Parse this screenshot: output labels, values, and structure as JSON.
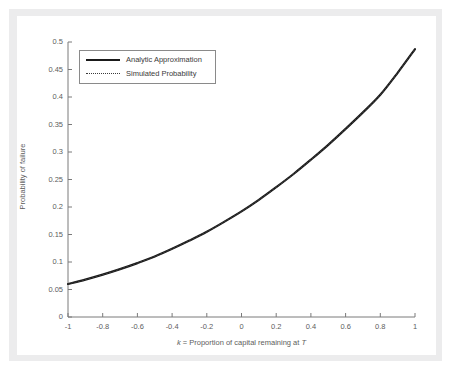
{
  "figure": {
    "background_color": "#ffffff",
    "frame_color": "#ececed",
    "axis_color": "#7a7a7a",
    "curve_color": "#1a1a1a"
  },
  "chart_data": {
    "type": "line",
    "title": "",
    "xlabel": "k = Proportion of capital remaining at T",
    "xlabel_parts": {
      "italic_k": "k",
      "middle": " = Proportion of capital remaining at ",
      "italic_T": "T"
    },
    "ylabel": "Probability of failure",
    "xlim": [
      -1,
      1
    ],
    "ylim": [
      0,
      0.5
    ],
    "grid": false,
    "legend_position": "upper left",
    "xticks": [
      -1,
      -0.8,
      -0.6,
      -0.4,
      -0.2,
      0,
      0.2,
      0.4,
      0.6,
      0.8,
      1
    ],
    "xtick_labels": [
      "-1",
      "-0.8",
      "-0.6",
      "-0.4",
      "-0.2",
      "0",
      "0.2",
      "0.4",
      "0.6",
      "0.8",
      "1"
    ],
    "yticks": [
      0,
      0.05,
      0.1,
      0.15,
      0.2,
      0.25,
      0.3,
      0.35,
      0.4,
      0.45,
      0.5
    ],
    "ytick_labels": [
      "0",
      "0.05",
      "0.1",
      "0.15",
      "0.2",
      "0.25",
      "0.3",
      "0.35",
      "0.4",
      "0.45",
      "0.5"
    ],
    "x": [
      -1,
      -0.9,
      -0.8,
      -0.7,
      -0.6,
      -0.5,
      -0.4,
      -0.3,
      -0.2,
      -0.1,
      0,
      0.1,
      0.2,
      0.3,
      0.4,
      0.5,
      0.6,
      0.7,
      0.8,
      0.9,
      1
    ],
    "series": [
      {
        "name": "Analytic Approximation",
        "style": "solid",
        "color": "#1a1a1a",
        "width": 2.2,
        "values": [
          0.06,
          0.068,
          0.077,
          0.087,
          0.098,
          0.11,
          0.124,
          0.139,
          0.155,
          0.173,
          0.192,
          0.213,
          0.236,
          0.26,
          0.286,
          0.313,
          0.342,
          0.372,
          0.404,
          0.444,
          0.487
        ]
      },
      {
        "name": "Simulated Probability",
        "style": "dotted",
        "color": "#3a3a3a",
        "width": 1.1,
        "values": [
          0.06,
          0.068,
          0.077,
          0.087,
          0.098,
          0.11,
          0.124,
          0.139,
          0.155,
          0.173,
          0.192,
          0.213,
          0.236,
          0.26,
          0.286,
          0.313,
          0.342,
          0.372,
          0.404,
          0.444,
          0.487
        ]
      }
    ],
    "legend_entries": [
      "Analytic Approximation",
      "Simulated Probability"
    ]
  }
}
